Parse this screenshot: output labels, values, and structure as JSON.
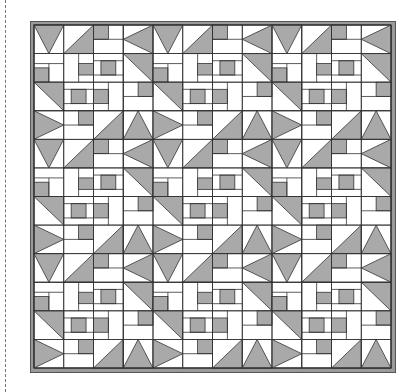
{
  "colors": {
    "fill": "#a9a9a9",
    "line": "#333333",
    "frame": "#9a9a9a",
    "background": "#ffffff"
  },
  "quilt": {
    "rows": 12,
    "cols": 12,
    "block_size": 3,
    "cells": [
      [
        "TD",
        "DBR",
        "SQTL",
        "TL",
        "TD",
        "DBR",
        "SQTL",
        "TL",
        "TD",
        "DBR",
        "SQTL",
        "TL"
      ],
      [
        "HSQ",
        "VSQ",
        "SQC",
        "DTR",
        "HSQ",
        "VSQ",
        "SQC",
        "DTR",
        "HSQ",
        "VSQ",
        "SQC",
        "DTR"
      ],
      [
        "DTR",
        "SQC",
        "SQL",
        "SQR",
        "DTR",
        "SQC",
        "SQL",
        "SQR",
        "DTR",
        "SQC",
        "SQL",
        "SQR"
      ],
      [
        "TR",
        "SQR",
        "DBR",
        "TU",
        "TR",
        "SQR",
        "DBR",
        "TU",
        "TR",
        "SQR",
        "DBR",
        "TU"
      ],
      [
        "TD",
        "DBR",
        "SQTL",
        "TL",
        "TD",
        "DBR",
        "SQTL",
        "TL",
        "TD",
        "DBR",
        "SQTL",
        "TL"
      ],
      [
        "HSQ",
        "VSQ",
        "SQC",
        "DTR",
        "HSQ",
        "VSQ",
        "SQC",
        "DTR",
        "HSQ",
        "VSQ",
        "SQC",
        "DTR"
      ],
      [
        "DTR",
        "SQC",
        "SQL",
        "SQR",
        "DTR",
        "SQC",
        "SQL",
        "SQR",
        "DTR",
        "SQC",
        "SQL",
        "SQR"
      ],
      [
        "TR",
        "SQR",
        "DBR",
        "TU",
        "TR",
        "SQR",
        "DBR",
        "TU",
        "TR",
        "SQR",
        "DBR",
        "TU"
      ],
      [
        "TD",
        "DBR",
        "SQTL",
        "TL",
        "TD",
        "DBR",
        "SQTL",
        "TL",
        "TD",
        "DBR",
        "SQTL",
        "TL"
      ],
      [
        "HSQ",
        "VSQ",
        "SQC",
        "DTR",
        "HSQ",
        "VSQ",
        "SQC",
        "DTR",
        "HSQ",
        "VSQ",
        "SQC",
        "DTR"
      ],
      [
        "DTR",
        "SQC",
        "SQL",
        "SQR",
        "DTR",
        "SQC",
        "SQL",
        "SQR",
        "DTR",
        "SQC",
        "SQL",
        "SQR"
      ],
      [
        "TR",
        "SQR",
        "DBR",
        "TU",
        "TR",
        "SQR",
        "DBR",
        "TU",
        "TR",
        "SQR",
        "DBR",
        "TU"
      ]
    ]
  }
}
